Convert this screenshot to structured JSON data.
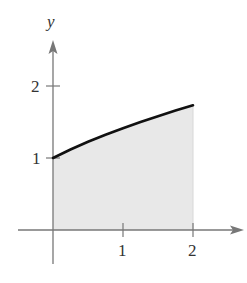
{
  "chart_data": {
    "type": "area",
    "title": "",
    "xlabel": "x",
    "ylabel": "y",
    "function": "y = sqrt(x + 1)",
    "x": [
      0,
      0.25,
      0.5,
      0.75,
      1,
      1.25,
      1.5,
      1.75,
      2
    ],
    "values": [
      1.0,
      1.118,
      1.225,
      1.323,
      1.414,
      1.5,
      1.581,
      1.658,
      1.732
    ],
    "shaded_region": {
      "x_from": 0,
      "x_to": 2,
      "under_curve": true
    },
    "xlim": [
      -0.5,
      2.6
    ],
    "ylim": [
      -0.5,
      2.5
    ],
    "x_ticks": [
      "1",
      "2"
    ],
    "y_ticks": [
      "1",
      "2"
    ],
    "grid": false,
    "legend": null,
    "colors": {
      "curve": "#111111",
      "fill": "#e8e8e8",
      "axis": "#777777"
    }
  },
  "labels": {
    "x_axis": "x",
    "y_axis": "y",
    "x_tick_1": "1",
    "x_tick_2": "2",
    "y_tick_1": "1",
    "y_tick_2": "2"
  }
}
